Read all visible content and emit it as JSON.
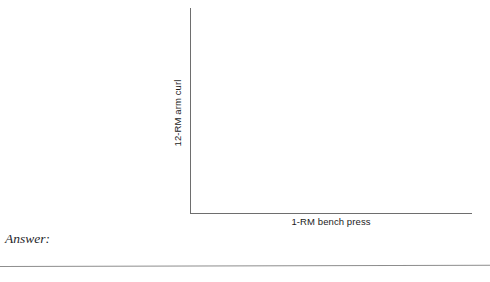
{
  "figure": {
    "kind": "empty-axes-worksheet",
    "background_color": "#ffffff",
    "axis_color": "#6e6e6e",
    "text_color": "#1b1b1b"
  },
  "chart_data": {
    "type": "scatter",
    "title": "",
    "subtitle": "",
    "xlabel": "1-RM bench press",
    "ylabel": "12-RM arm curl",
    "x": [],
    "y": [],
    "series": [],
    "xticklabels": [],
    "yticklabels": [],
    "xlim": null,
    "ylim": null,
    "grid": false,
    "legend": false,
    "legend_position": "none",
    "annotations": [],
    "note": "Blank axes with labeled x and y axes and no plotted data points, ticks, or gridlines; provided for the reader to sketch a relationship."
  },
  "prompt": {
    "answer_label": "Answer:"
  },
  "separator": {
    "rule_color": "#8d8d8d"
  }
}
